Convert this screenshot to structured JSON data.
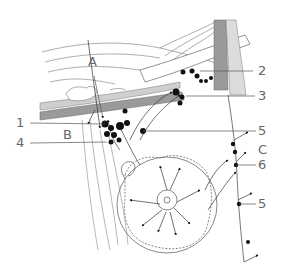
{
  "diagram": {
    "labels": {
      "A": "A",
      "B": "B",
      "C": "C",
      "n1": "1",
      "n2": "2",
      "n3": "3",
      "n4": "4",
      "n5a": "5",
      "n5b": "5",
      "n6": "6"
    },
    "colors": {
      "line": "#555555",
      "vessel_dark": "#9a9a9a",
      "vessel_light": "#cfcfcf",
      "node": "#111111",
      "label": "#666666"
    }
  }
}
